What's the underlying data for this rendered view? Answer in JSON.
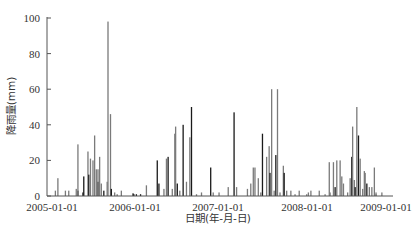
{
  "chart_data": {
    "type": "bar",
    "title": "",
    "xlabel": "日期(年-月-日)",
    "ylabel": "降雨量(mm)",
    "ylim": [
      0,
      100
    ],
    "yticks": [
      0,
      20,
      40,
      60,
      80,
      100
    ],
    "xticks": [
      "2005-01-01",
      "2006-01-01",
      "2007-01-01",
      "2008-01-01",
      "2009-01-01"
    ],
    "xrange_years": [
      2004.94,
      2009.09
    ],
    "grid": false,
    "legend": null,
    "bar_colors": [
      "#7a7a7a",
      "#1a1a1a"
    ],
    "bars": [
      {
        "t": 2005.04,
        "v": 3,
        "c": 0
      },
      {
        "t": 2005.07,
        "v": 10,
        "c": 0
      },
      {
        "t": 2005.16,
        "v": 3,
        "c": 0
      },
      {
        "t": 2005.2,
        "v": 3,
        "c": 0
      },
      {
        "t": 2005.29,
        "v": 4,
        "c": 0
      },
      {
        "t": 2005.31,
        "v": 3,
        "c": 1
      },
      {
        "t": 2005.31,
        "v": 29,
        "c": 0
      },
      {
        "t": 2005.37,
        "v": 2,
        "c": 1
      },
      {
        "t": 2005.38,
        "v": 11,
        "c": 1
      },
      {
        "t": 2005.43,
        "v": 25,
        "c": 0
      },
      {
        "t": 2005.44,
        "v": 12,
        "c": 1
      },
      {
        "t": 2005.46,
        "v": 21,
        "c": 0
      },
      {
        "t": 2005.49,
        "v": 20,
        "c": 0
      },
      {
        "t": 2005.51,
        "v": 34,
        "c": 0
      },
      {
        "t": 2005.53,
        "v": 15,
        "c": 0
      },
      {
        "t": 2005.55,
        "v": 8,
        "c": 1
      },
      {
        "t": 2005.55,
        "v": 15,
        "c": 0
      },
      {
        "t": 2005.57,
        "v": 22,
        "c": 0
      },
      {
        "t": 2005.59,
        "v": 7,
        "c": 0
      },
      {
        "t": 2005.62,
        "v": 3,
        "c": 1
      },
      {
        "t": 2005.66,
        "v": 8,
        "c": 0
      },
      {
        "t": 2005.67,
        "v": 98,
        "c": 0
      },
      {
        "t": 2005.7,
        "v": 46,
        "c": 0
      },
      {
        "t": 2005.71,
        "v": 4,
        "c": 1
      },
      {
        "t": 2005.75,
        "v": 2,
        "c": 0
      },
      {
        "t": 2005.78,
        "v": 1,
        "c": 0
      },
      {
        "t": 2005.83,
        "v": 3,
        "c": 0
      },
      {
        "t": 2005.97,
        "v": 1.5,
        "c": 1
      },
      {
        "t": 2005.98,
        "v": 1,
        "c": 1
      },
      {
        "t": 2006.01,
        "v": 1,
        "c": 1
      },
      {
        "t": 2006.06,
        "v": 1,
        "c": 1
      },
      {
        "t": 2006.13,
        "v": 6,
        "c": 0
      },
      {
        "t": 2006.26,
        "v": 20,
        "c": 1
      },
      {
        "t": 2006.28,
        "v": 7,
        "c": 1
      },
      {
        "t": 2006.34,
        "v": 4,
        "c": 0
      },
      {
        "t": 2006.37,
        "v": 21,
        "c": 0
      },
      {
        "t": 2006.39,
        "v": 22,
        "c": 1
      },
      {
        "t": 2006.44,
        "v": 4,
        "c": 0
      },
      {
        "t": 2006.47,
        "v": 35,
        "c": 0
      },
      {
        "t": 2006.48,
        "v": 39,
        "c": 0
      },
      {
        "t": 2006.5,
        "v": 7,
        "c": 1
      },
      {
        "t": 2006.53,
        "v": 3,
        "c": 0
      },
      {
        "t": 2006.57,
        "v": 40,
        "c": 1
      },
      {
        "t": 2006.61,
        "v": 8,
        "c": 0
      },
      {
        "t": 2006.65,
        "v": 33,
        "c": 0
      },
      {
        "t": 2006.67,
        "v": 50,
        "c": 1
      },
      {
        "t": 2006.73,
        "v": 1,
        "c": 0
      },
      {
        "t": 2006.79,
        "v": 2,
        "c": 0
      },
      {
        "t": 2006.9,
        "v": 16,
        "c": 1
      },
      {
        "t": 2006.93,
        "v": 2,
        "c": 0
      },
      {
        "t": 2007.0,
        "v": 2,
        "c": 0
      },
      {
        "t": 2007.11,
        "v": 5,
        "c": 0
      },
      {
        "t": 2007.18,
        "v": 47,
        "c": 1
      },
      {
        "t": 2007.21,
        "v": 5,
        "c": 0
      },
      {
        "t": 2007.34,
        "v": 4,
        "c": 0
      },
      {
        "t": 2007.38,
        "v": 7,
        "c": 0
      },
      {
        "t": 2007.41,
        "v": 16,
        "c": 0
      },
      {
        "t": 2007.43,
        "v": 16,
        "c": 0
      },
      {
        "t": 2007.47,
        "v": 10,
        "c": 0
      },
      {
        "t": 2007.5,
        "v": 2,
        "c": 0
      },
      {
        "t": 2007.52,
        "v": 35,
        "c": 1
      },
      {
        "t": 2007.57,
        "v": 22,
        "c": 0
      },
      {
        "t": 2007.6,
        "v": 28,
        "c": 0
      },
      {
        "t": 2007.61,
        "v": 13,
        "c": 1
      },
      {
        "t": 2007.63,
        "v": 60,
        "c": 0
      },
      {
        "t": 2007.66,
        "v": 3,
        "c": 0
      },
      {
        "t": 2007.68,
        "v": 23,
        "c": 1
      },
      {
        "t": 2007.7,
        "v": 60,
        "c": 0
      },
      {
        "t": 2007.73,
        "v": 2,
        "c": 0
      },
      {
        "t": 2007.77,
        "v": 17,
        "c": 0
      },
      {
        "t": 2007.78,
        "v": 13,
        "c": 1
      },
      {
        "t": 2007.81,
        "v": 3,
        "c": 0
      },
      {
        "t": 2007.86,
        "v": 3,
        "c": 0
      },
      {
        "t": 2007.91,
        "v": 1,
        "c": 0
      },
      {
        "t": 2007.96,
        "v": 3,
        "c": 0
      },
      {
        "t": 2008.05,
        "v": 1,
        "c": 0
      },
      {
        "t": 2008.07,
        "v": 2,
        "c": 0
      },
      {
        "t": 2008.1,
        "v": 3,
        "c": 0
      },
      {
        "t": 2008.2,
        "v": 3,
        "c": 0
      },
      {
        "t": 2008.27,
        "v": 1,
        "c": 0
      },
      {
        "t": 2008.32,
        "v": 19,
        "c": 0
      },
      {
        "t": 2008.33,
        "v": 2,
        "c": 0
      },
      {
        "t": 2008.37,
        "v": 19,
        "c": 0
      },
      {
        "t": 2008.39,
        "v": 5,
        "c": 1
      },
      {
        "t": 2008.41,
        "v": 20,
        "c": 0
      },
      {
        "t": 2008.45,
        "v": 20,
        "c": 0
      },
      {
        "t": 2008.47,
        "v": 11,
        "c": 0
      },
      {
        "t": 2008.49,
        "v": 7,
        "c": 0
      },
      {
        "t": 2008.54,
        "v": 2,
        "c": 0
      },
      {
        "t": 2008.57,
        "v": 10,
        "c": 0
      },
      {
        "t": 2008.59,
        "v": 22,
        "c": 1
      },
      {
        "t": 2008.6,
        "v": 39,
        "c": 0
      },
      {
        "t": 2008.62,
        "v": 9,
        "c": 0
      },
      {
        "t": 2008.63,
        "v": 5,
        "c": 1
      },
      {
        "t": 2008.65,
        "v": 50,
        "c": 0
      },
      {
        "t": 2008.67,
        "v": 34,
        "c": 1
      },
      {
        "t": 2008.69,
        "v": 21,
        "c": 0
      },
      {
        "t": 2008.72,
        "v": 4,
        "c": 0
      },
      {
        "t": 2008.74,
        "v": 14,
        "c": 0
      },
      {
        "t": 2008.75,
        "v": 13,
        "c": 0
      },
      {
        "t": 2008.77,
        "v": 7,
        "c": 1
      },
      {
        "t": 2008.8,
        "v": 5,
        "c": 0
      },
      {
        "t": 2008.83,
        "v": 5,
        "c": 0
      },
      {
        "t": 2008.86,
        "v": 16,
        "c": 0
      },
      {
        "t": 2008.88,
        "v": 1,
        "c": 0
      },
      {
        "t": 2008.88,
        "v": 2,
        "c": 0
      },
      {
        "t": 2008.95,
        "v": 2,
        "c": 0
      }
    ]
  },
  "axes": {
    "ylabel": "降雨量(mm)",
    "xlabel": "日期(年-月-日)",
    "yticks": [
      "0",
      "20",
      "40",
      "60",
      "80",
      "100"
    ],
    "xticks": [
      "2005-01-01",
      "2006-01-01",
      "2007-01-01",
      "2008-01-01",
      "2009-01-01"
    ]
  }
}
